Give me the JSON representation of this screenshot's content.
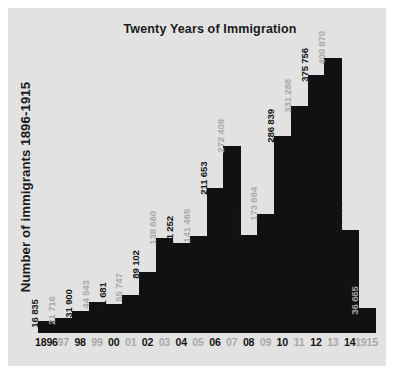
{
  "figure": {
    "background_color": "#e2e2e2",
    "bar_color": "#111111",
    "label_black": "#161616",
    "label_gray": "#a9a9a9"
  },
  "chart_data": {
    "type": "bar",
    "title": "Twenty Years of Immigration",
    "xlabel": "",
    "ylabel": "Number of immigrants 1896-1915",
    "grid": false,
    "legend": null,
    "ylim": [
      0,
      400870
    ],
    "categories": [
      "1896",
      "97",
      "98",
      "99",
      "00",
      "01",
      "02",
      "03",
      "04",
      "05",
      "06",
      "07",
      "08",
      "09",
      "10",
      "11",
      "12",
      "13",
      "14",
      "1915"
    ],
    "years_full": [
      1896,
      1897,
      1898,
      1899,
      1900,
      1901,
      1902,
      1903,
      1904,
      1905,
      1906,
      1907,
      1908,
      1909,
      1910,
      1911,
      1912,
      1913,
      1914,
      1915
    ],
    "values": [
      16835,
      21716,
      31900,
      44543,
      41681,
      55747,
      89102,
      138660,
      131252,
      141465,
      211653,
      272409,
      143326,
      173694,
      286839,
      331288,
      375756,
      400870,
      150484,
      36665
    ],
    "value_labels": [
      "16 835",
      "21 716",
      "31 900",
      "44 543",
      "41 681",
      "55 747",
      "89 102",
      "138 660",
      "131 252",
      "141 465",
      "211 653",
      "272 409",
      "143 326",
      "173 694",
      "286 839",
      "331 288",
      "375 756",
      "400 870",
      "150 484",
      "36 665"
    ],
    "label_styles": [
      "black",
      "gray",
      "black",
      "gray",
      "black",
      "gray",
      "black",
      "gray",
      "black",
      "gray",
      "black",
      "gray",
      "black",
      "gray",
      "black",
      "gray",
      "black",
      "gray",
      "black",
      "gray"
    ],
    "tick_styles": [
      "black",
      "gray",
      "black",
      "gray",
      "black",
      "gray",
      "black",
      "gray",
      "black",
      "gray",
      "black",
      "gray",
      "black",
      "gray",
      "black",
      "gray",
      "black",
      "gray",
      "black",
      "gray"
    ]
  }
}
